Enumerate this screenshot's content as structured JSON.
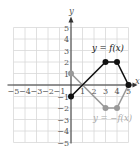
{
  "chart_data": {
    "type": "line",
    "title": "",
    "xlabel": "x",
    "ylabel": "y",
    "xlim": [
      -5,
      5
    ],
    "ylim": [
      -5,
      5
    ],
    "grid": true,
    "x_ticks": [
      -5,
      -4,
      -3,
      -2,
      -1,
      1,
      2,
      3,
      4,
      5
    ],
    "y_ticks": [
      5,
      4,
      3,
      2,
      1,
      -1,
      -2,
      -3,
      -4,
      -5
    ],
    "series": [
      {
        "name": "y = f(x)",
        "color": "#111111",
        "points": [
          [
            0,
            -1
          ],
          [
            3,
            2
          ],
          [
            4,
            2
          ],
          [
            5,
            0
          ]
        ]
      },
      {
        "name": "y = −f(x)",
        "color": "#999999",
        "points": [
          [
            0,
            1
          ],
          [
            3,
            -2
          ],
          [
            4,
            -2
          ],
          [
            5,
            0
          ]
        ]
      }
    ],
    "annotations": [
      {
        "text": "y = f(x)",
        "x": 3.5,
        "y": 3.2
      },
      {
        "text": "y = −f(x)",
        "x": 4,
        "y": -2.9
      }
    ]
  },
  "labels": {
    "x_axis": "x",
    "y_axis": "y",
    "f_label": "y = f(x)",
    "neg_f_label": "y = −f(x)"
  }
}
